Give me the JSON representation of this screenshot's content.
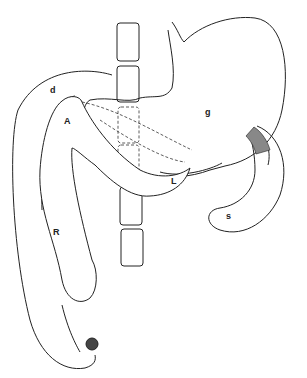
{
  "diagram": {
    "type": "anatomical-line-drawing",
    "labels": [
      {
        "id": "d",
        "text": "d",
        "x": 50,
        "y": 93
      },
      {
        "id": "g",
        "text": "g",
        "x": 205,
        "y": 115
      },
      {
        "id": "A",
        "text": "A",
        "x": 64,
        "y": 124
      },
      {
        "id": "L",
        "text": "L",
        "x": 171,
        "y": 184
      },
      {
        "id": "R",
        "text": "R",
        "x": 53,
        "y": 235
      },
      {
        "id": "s",
        "text": "s",
        "x": 226,
        "y": 219
      }
    ],
    "vertebrae_count": 7,
    "stroke_color": "#222222",
    "background": "#ffffff"
  }
}
